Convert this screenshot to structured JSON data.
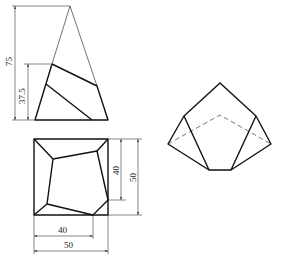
{
  "figure": {
    "front_view": {
      "name": "cut pyramid front view",
      "dimensions": [
        {
          "label": "75",
          "orientation": "vertical"
        },
        {
          "label": "37.5",
          "orientation": "vertical"
        }
      ]
    },
    "top_view": {
      "name": "cut pyramid top view",
      "dimensions": [
        {
          "label": "40",
          "orientation": "vertical"
        },
        {
          "label": "50",
          "orientation": "vertical"
        },
        {
          "label": "40",
          "orientation": "horizontal"
        },
        {
          "label": "50",
          "orientation": "horizontal"
        }
      ]
    },
    "isometric_view": {
      "name": "cut pyramid isometric view"
    }
  },
  "colors": {
    "line": "#111111",
    "thin_line": "#333333",
    "background": "#ffffff"
  }
}
